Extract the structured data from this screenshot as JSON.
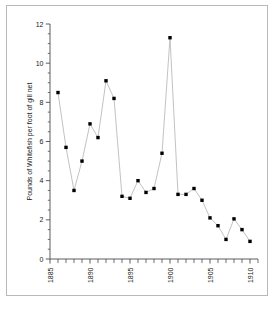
{
  "chart_data": {
    "type": "line",
    "title": "",
    "subtitle": "",
    "xlabel": "",
    "ylabel": "Pounds of Whitefish per foot of gill net",
    "xlim": [
      1885,
      1911
    ],
    "ylim": [
      0,
      12
    ],
    "grid": false,
    "legend": null,
    "marker": "filled-square",
    "marker_color": "#000000",
    "line_color": "#a8a8a8",
    "y_ticks": [
      0,
      2,
      4,
      6,
      8,
      10,
      12
    ],
    "y_tick_labels": [
      "0",
      "2",
      "4",
      "6",
      "8",
      "10",
      "12"
    ],
    "y_minor_step": 0.5,
    "x_ticks": [
      1885,
      1886,
      1887,
      1888,
      1889,
      1890,
      1891,
      1892,
      1893,
      1894,
      1895,
      1896,
      1897,
      1898,
      1899,
      1900,
      1901,
      1902,
      1903,
      1904,
      1905,
      1906,
      1907,
      1908,
      1909,
      1910,
      1911
    ],
    "x_labeled_ticks": [
      1885,
      1890,
      1895,
      1900,
      1905,
      1910
    ],
    "x_tick_labels": [
      "1885",
      "1890",
      "1895",
      "1900",
      "1905",
      "1910"
    ],
    "x_tick_label_rotation": -90,
    "x": [
      1886,
      1887,
      1888,
      1889,
      1890,
      1891,
      1892,
      1893,
      1894,
      1895,
      1896,
      1897,
      1898,
      1899,
      1900,
      1901,
      1902,
      1903,
      1904,
      1905,
      1906,
      1907,
      1908,
      1909,
      1910
    ],
    "values": [
      8.5,
      5.7,
      3.5,
      5.0,
      6.9,
      6.2,
      9.1,
      8.2,
      3.2,
      3.1,
      4.0,
      3.4,
      3.6,
      5.4,
      11.3,
      3.3,
      3.3,
      3.6,
      3.0,
      2.1,
      1.7,
      1.0,
      2.05,
      1.5,
      0.9
    ]
  }
}
